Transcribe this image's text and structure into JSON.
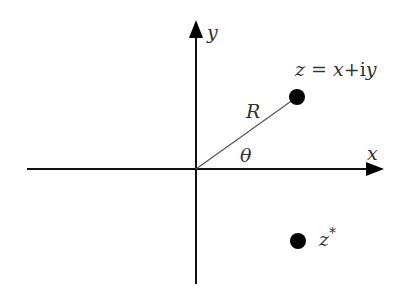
{
  "diagram": {
    "axes": {
      "x_label": "x",
      "y_label": "y"
    },
    "points": [
      {
        "id": "z",
        "label_parts": [
          "z",
          " = ",
          "x",
          "+i",
          "y"
        ]
      },
      {
        "id": "z_conj",
        "label_base": "z",
        "label_sup": "*"
      }
    ],
    "vector": {
      "magnitude_label": "R",
      "angle_label": "θ"
    },
    "colors": {
      "ink": "#000000",
      "text": "#333333",
      "vector_line": "#555555"
    }
  }
}
